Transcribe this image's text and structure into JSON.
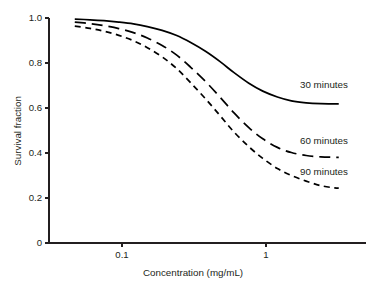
{
  "chart_data": {
    "type": "line",
    "title": "",
    "xlabel": "Concentration (mg/mL)",
    "ylabel": "Survival fraction",
    "xscale": "log",
    "yscale": "linear",
    "xlim": [
      0.045,
      3.3
    ],
    "ylim": [
      0,
      1.0
    ],
    "grid": false,
    "legend_position": "inline-right",
    "xticks": [
      0.1,
      1
    ],
    "xtick_labels": [
      "0.1",
      "1"
    ],
    "yticks": [
      0,
      0.2,
      0.4,
      0.6,
      0.8,
      1.0
    ],
    "ytick_labels": [
      "0",
      "0.2",
      "0.4",
      "0.6",
      "0.8",
      "1.0"
    ],
    "series": [
      {
        "name": "30 minutes",
        "label": "30 minutes",
        "style": "solid",
        "color": "#000000",
        "x": [
          0.047,
          0.06,
          0.075,
          0.095,
          0.12,
          0.15,
          0.19,
          0.24,
          0.3,
          0.38,
          0.48,
          0.6,
          0.76,
          0.95,
          1.2,
          1.5,
          1.9,
          2.4,
          3.0,
          3.2
        ],
        "y": [
          0.995,
          0.992,
          0.988,
          0.982,
          0.974,
          0.962,
          0.945,
          0.922,
          0.891,
          0.852,
          0.806,
          0.757,
          0.71,
          0.675,
          0.649,
          0.632,
          0.623,
          0.619,
          0.618,
          0.618
        ]
      },
      {
        "name": "60 minutes",
        "label": "60 minutes",
        "style": "dashed-long",
        "color": "#000000",
        "x": [
          0.047,
          0.06,
          0.075,
          0.095,
          0.12,
          0.15,
          0.19,
          0.24,
          0.3,
          0.38,
          0.48,
          0.6,
          0.76,
          0.95,
          1.2,
          1.5,
          1.9,
          2.4,
          3.0,
          3.2
        ],
        "y": [
          0.982,
          0.975,
          0.966,
          0.953,
          0.935,
          0.911,
          0.878,
          0.835,
          0.781,
          0.718,
          0.648,
          0.578,
          0.513,
          0.463,
          0.425,
          0.402,
          0.389,
          0.383,
          0.381,
          0.381
        ]
      },
      {
        "name": "90 minutes",
        "label": "90 minutes",
        "style": "dashed-short",
        "color": "#000000",
        "x": [
          0.047,
          0.06,
          0.075,
          0.095,
          0.12,
          0.15,
          0.19,
          0.24,
          0.3,
          0.38,
          0.48,
          0.6,
          0.76,
          0.95,
          1.2,
          1.5,
          1.9,
          2.4,
          3.0,
          3.2
        ],
        "y": [
          0.964,
          0.954,
          0.941,
          0.923,
          0.899,
          0.868,
          0.827,
          0.775,
          0.712,
          0.641,
          0.566,
          0.493,
          0.428,
          0.376,
          0.331,
          0.3,
          0.275,
          0.255,
          0.245,
          0.244
        ]
      }
    ]
  }
}
